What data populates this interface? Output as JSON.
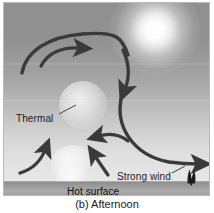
{
  "figure": {
    "caption": "(b) Afternoon",
    "panel_label_letter": "(b)",
    "scene_name": "afternoon-convection-diagram"
  },
  "labels": {
    "thermal": "Thermal",
    "strong_wind": "Strong wind",
    "hot_surface": "Hot surface"
  },
  "elements": {
    "sun": "sun-glow",
    "ground": "hot-surface-ground-strip",
    "tree": "tree-silhouette",
    "thermal_upper": "rising-thermal-bubble-upper",
    "thermal_lower": "rising-thermal-bubble-lower"
  },
  "arrows": [
    {
      "name": "rising-left-arrow",
      "direction": "up-right",
      "description": "large curved updraft from lower left sweeping up and right across the top"
    },
    {
      "name": "top-right-turn-arrow",
      "direction": "right",
      "description": "short arrow pointing right in upper middle"
    },
    {
      "name": "descending-right-arrow",
      "direction": "down",
      "description": "arrow curving down on the right side"
    },
    {
      "name": "sinking-outflow-arrow",
      "direction": "right",
      "description": "long arrow sinking then sweeping right along the surface"
    },
    {
      "name": "return-flow-arrow",
      "direction": "left",
      "description": "small arrow pointing left in mid scene"
    },
    {
      "name": "surface-updraft-arrow",
      "direction": "up-right",
      "description": "small arrow rising from lower left"
    },
    {
      "name": "strong-wind-arrow",
      "direction": "up-left",
      "description": "short arrow pointing up-left near the strong wind label"
    }
  ],
  "colors": {
    "arrow": "#3a3a3a",
    "sky_top": "#8f8f8f",
    "sky_horizon": "#e7e7e7",
    "ground": "#9d9d9d",
    "text": "#1b1b1b",
    "sun": "#ffffff"
  }
}
